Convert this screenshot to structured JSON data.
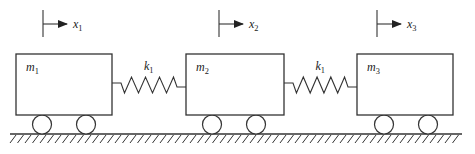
{
  "diagram": {
    "stroke_color": "#333333",
    "masses": [
      {
        "label": "m",
        "sub": "1",
        "x": 16,
        "y": 54,
        "w": 96,
        "h": 61
      },
      {
        "label": "m",
        "sub": "2",
        "x": 186,
        "y": 54,
        "w": 98,
        "h": 61
      },
      {
        "label": "m",
        "sub": "3",
        "x": 357,
        "y": 54,
        "w": 96,
        "h": 61
      }
    ],
    "springs": [
      {
        "label": "k",
        "sub": "1",
        "from_x": 112,
        "to_x": 186,
        "y": 85
      },
      {
        "label": "k",
        "sub": "1",
        "from_x": 284,
        "to_x": 357,
        "y": 85
      }
    ],
    "displacements": [
      {
        "label": "x",
        "sub": "1",
        "x": 43
      },
      {
        "label": "x",
        "sub": "2",
        "x": 219
      },
      {
        "label": "x",
        "sub": "3",
        "x": 377
      }
    ],
    "wheels": [
      {
        "cx": 42
      },
      {
        "cx": 86
      },
      {
        "cx": 212
      },
      {
        "cx": 256
      },
      {
        "cx": 384
      },
      {
        "cx": 428
      }
    ],
    "ground": {
      "y": 134,
      "x1": 10,
      "x2": 462
    }
  }
}
